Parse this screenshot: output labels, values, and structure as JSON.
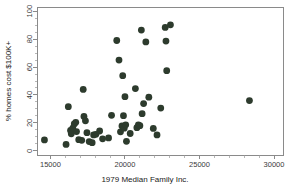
{
  "chart_data": {
    "type": "scatter",
    "title": "",
    "subtitle": "",
    "xlabel": "1979 Median Family Inc.",
    "ylabel": "% homes cost $100K+",
    "xlim": [
      14100,
      30600
    ],
    "ylim": [
      -3,
      103
    ],
    "xticks": [
      15000,
      20000,
      25000,
      30000
    ],
    "xtick_labels": [
      "15000",
      "20000",
      "25000",
      "30000"
    ],
    "yticks": [
      0,
      20,
      40,
      60,
      80,
      100
    ],
    "ytick_labels": [
      "0",
      "20",
      "40",
      "60",
      "80",
      "100"
    ],
    "grid": false,
    "legend": null,
    "marker": {
      "shape": "circle",
      "color": "#2d3b2d",
      "size": 3.4
    },
    "points": [
      {
        "x": 14600,
        "y": 7.8
      },
      {
        "x": 16050,
        "y": 4.6
      },
      {
        "x": 16200,
        "y": 31.6
      },
      {
        "x": 16350,
        "y": 14.6
      },
      {
        "x": 16400,
        "y": 12.2
      },
      {
        "x": 16500,
        "y": 16.3
      },
      {
        "x": 16600,
        "y": 19.2
      },
      {
        "x": 16700,
        "y": 20.4
      },
      {
        "x": 16750,
        "y": 13.8
      },
      {
        "x": 16900,
        "y": 8.0
      },
      {
        "x": 17100,
        "y": 7.5
      },
      {
        "x": 17200,
        "y": 44.0
      },
      {
        "x": 17250,
        "y": 24.6
      },
      {
        "x": 17350,
        "y": 21.5
      },
      {
        "x": 17450,
        "y": 13.0
      },
      {
        "x": 17600,
        "y": 6.6
      },
      {
        "x": 17800,
        "y": 5.8
      },
      {
        "x": 17900,
        "y": 11.4
      },
      {
        "x": 18050,
        "y": 11.8
      },
      {
        "x": 18300,
        "y": 14.2
      },
      {
        "x": 18500,
        "y": 8.6
      },
      {
        "x": 18900,
        "y": 9.2
      },
      {
        "x": 19100,
        "y": 25.4
      },
      {
        "x": 19450,
        "y": 79.0
      },
      {
        "x": 19600,
        "y": 65.0
      },
      {
        "x": 19700,
        "y": 13.6
      },
      {
        "x": 19800,
        "y": 17.8
      },
      {
        "x": 19850,
        "y": 53.8
      },
      {
        "x": 19900,
        "y": 25.2
      },
      {
        "x": 19950,
        "y": 16.2
      },
      {
        "x": 20000,
        "y": 38.8
      },
      {
        "x": 20050,
        "y": 18.6
      },
      {
        "x": 20100,
        "y": 6.8
      },
      {
        "x": 20350,
        "y": 12.4
      },
      {
        "x": 20700,
        "y": 44.6
      },
      {
        "x": 20800,
        "y": 16.6
      },
      {
        "x": 20900,
        "y": 18.6
      },
      {
        "x": 21000,
        "y": 18.0
      },
      {
        "x": 21100,
        "y": 86.5
      },
      {
        "x": 21150,
        "y": 26.6
      },
      {
        "x": 21250,
        "y": 33.8
      },
      {
        "x": 21400,
        "y": 78.0
      },
      {
        "x": 21600,
        "y": 38.4
      },
      {
        "x": 21900,
        "y": 16.0
      },
      {
        "x": 22150,
        "y": 11.4
      },
      {
        "x": 22400,
        "y": 30.6
      },
      {
        "x": 22700,
        "y": 88.4
      },
      {
        "x": 22750,
        "y": 78.6
      },
      {
        "x": 22800,
        "y": 57.4
      },
      {
        "x": 23050,
        "y": 90.2
      },
      {
        "x": 28350,
        "y": 36.0
      }
    ]
  },
  "axes": {
    "x_axis_name": "x-axis",
    "y_axis_name": "y-axis"
  }
}
